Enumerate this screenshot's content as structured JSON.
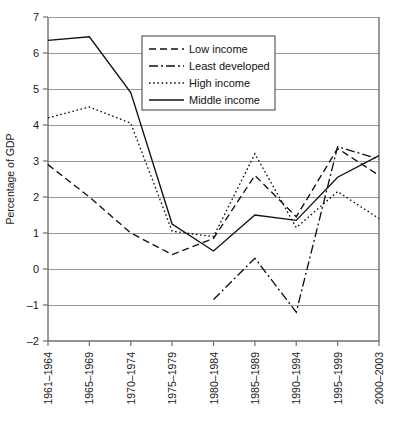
{
  "chart_data": {
    "type": "line",
    "title": "",
    "xlabel": "",
    "ylabel": "Percentage of GDP",
    "ylim": [
      -2,
      7
    ],
    "ytick_step": 1,
    "yticks": [
      "7",
      "6",
      "5",
      "4",
      "3",
      "2",
      "1",
      "0",
      "-1",
      "-2"
    ],
    "grid": true,
    "legend_position": "top-center",
    "categories": [
      "1961-1964",
      "1965-1969",
      "1970-1974",
      "1975-1979",
      "1980-1984",
      "1985-1989",
      "1990-1994",
      "1995-1999",
      "2000-2003"
    ],
    "series": [
      {
        "name": "Low income",
        "style": "dashed",
        "dash": "7,4",
        "values": [
          2.9,
          2.0,
          1.0,
          0.4,
          0.85,
          2.6,
          1.45,
          3.35,
          2.6
        ]
      },
      {
        "name": "Least developed",
        "style": "dash-dot",
        "dash": "9,3,2,3",
        "values": [
          null,
          null,
          null,
          null,
          -0.85,
          0.3,
          -1.2,
          3.4,
          3.05
        ]
      },
      {
        "name": "High income",
        "style": "dotted",
        "dash": "1.6,2.6",
        "values": [
          4.2,
          4.5,
          4.05,
          1.05,
          0.9,
          3.2,
          1.15,
          2.15,
          1.4
        ]
      },
      {
        "name": "Middle income",
        "style": "solid",
        "dash": "none",
        "values": [
          6.35,
          6.45,
          4.9,
          1.25,
          0.5,
          1.5,
          1.35,
          2.55,
          3.15
        ]
      }
    ]
  },
  "legend": {
    "items": [
      {
        "label": "Low income"
      },
      {
        "label": "Least developed"
      },
      {
        "label": "High income"
      },
      {
        "label": "Middle income"
      }
    ]
  },
  "colors": {
    "line": "#111111",
    "grid": "#9a9a9a",
    "axis": "#6f6f6f",
    "background": "#ffffff"
  }
}
